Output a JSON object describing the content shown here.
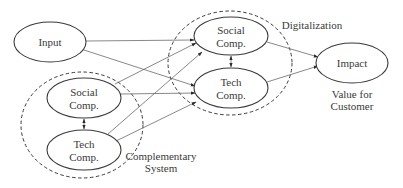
{
  "diagram": {
    "nodes": {
      "input": {
        "label": "Input"
      },
      "social_left": {
        "line1": "Social",
        "line2": "Comp."
      },
      "tech_left": {
        "line1": "Tech",
        "line2": "Comp."
      },
      "social_right": {
        "line1": "Social",
        "line2": "Comp."
      },
      "tech_right": {
        "line1": "Tech",
        "line2": "Comp."
      },
      "impact": {
        "label": "Impact"
      }
    },
    "groups": {
      "complementary": {
        "line1": "Complementary",
        "line2": "System"
      },
      "digitalization": {
        "label": "Digitalization"
      }
    },
    "captions": {
      "impact_caption": {
        "line1": "Value for",
        "line2": "Customer"
      }
    },
    "edges": [
      {
        "from": "Input",
        "to": "Social Comp. (Digitalization)"
      },
      {
        "from": "Input",
        "to": "Tech Comp. (Digitalization)"
      },
      {
        "from": "Social Comp. (Complementary)",
        "to": "Social Comp. (Digitalization)"
      },
      {
        "from": "Social Comp. (Complementary)",
        "to": "Tech Comp. (Digitalization)"
      },
      {
        "from": "Tech Comp. (Complementary)",
        "to": "Social Comp. (Digitalization)"
      },
      {
        "from": "Tech Comp. (Complementary)",
        "to": "Tech Comp. (Digitalization)"
      },
      {
        "from": "Social Comp. (Digitalization)",
        "to": "Impact"
      },
      {
        "from": "Tech Comp. (Digitalization)",
        "to": "Impact"
      },
      {
        "from": "Social Comp. (Complementary)",
        "to": "Tech Comp. (Complementary)",
        "bidirectional": true
      },
      {
        "from": "Social Comp. (Digitalization)",
        "to": "Tech Comp. (Digitalization)",
        "bidirectional": true
      }
    ]
  }
}
